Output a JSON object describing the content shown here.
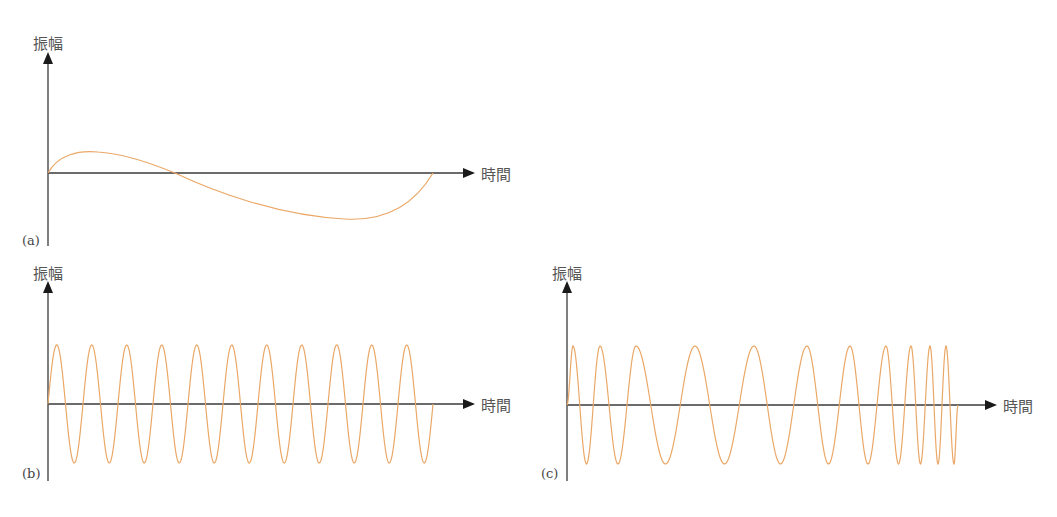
{
  "colors": {
    "wave": "#eaa868",
    "axis": "#3a3a3a",
    "text": "#555555"
  },
  "panels": [
    {
      "id": "a",
      "tag": "(a)",
      "y_label": "振幅",
      "x_label": "時間",
      "description": "Single low-frequency oscillation (one cycle, slightly asymmetric)"
    },
    {
      "id": "b",
      "tag": "(b)",
      "y_label": "振幅",
      "x_label": "時間",
      "description": "Constant high-frequency oscillation (11 cycles)"
    },
    {
      "id": "c",
      "tag": "(c)",
      "y_label": "振幅",
      "x_label": "時間",
      "description": "Frequency-modulated oscillation: fast, slowing, then speeding up again"
    }
  ],
  "chart_data": [
    {
      "type": "line",
      "title": "(a)",
      "xlabel": "時間",
      "ylabel": "振幅",
      "x": [
        0,
        0.11,
        0.3,
        0.7,
        0.9,
        1.0
      ],
      "values": [
        0,
        0.45,
        0,
        -1.0,
        -0.6,
        0
      ],
      "grid": false
    },
    {
      "type": "line",
      "title": "(b)",
      "xlabel": "時間",
      "ylabel": "振幅",
      "cycles": 11,
      "amplitude": 1.0,
      "frequency": "constant",
      "grid": false
    },
    {
      "type": "line",
      "title": "(c)",
      "xlabel": "時間",
      "ylabel": "振幅",
      "amplitude": 1.0,
      "peaks_x_px": [
        573,
        600,
        636,
        695,
        754,
        807,
        850,
        886,
        911,
        930,
        946
      ],
      "frequency": "high → low → high (chirp)",
      "grid": false
    }
  ]
}
